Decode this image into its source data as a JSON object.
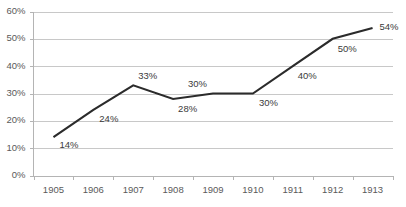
{
  "chart_data": {
    "type": "line",
    "title": "",
    "xlabel": "",
    "ylabel": "",
    "categories": [
      "1905",
      "1906",
      "1907",
      "1908",
      "1909",
      "1910",
      "1911",
      "1912",
      "1913"
    ],
    "values": [
      14,
      24,
      33,
      28,
      30,
      30,
      40,
      50,
      54
    ],
    "point_labels": [
      "14%",
      "24%",
      "33%",
      "28%",
      "30%",
      "30%",
      "40%",
      "50%",
      "54%"
    ],
    "ylim": [
      0,
      60
    ],
    "ytick_values": [
      0,
      10,
      20,
      30,
      40,
      50,
      60
    ],
    "ytick_labels": [
      "0%",
      "10%",
      "20%",
      "30%",
      "40%",
      "50%",
      "60%"
    ],
    "grid": true,
    "legend": "none",
    "series_color": "#2b2b2b",
    "grid_color": "#c8c8c8",
    "axis_color": "#b4b4b4",
    "tick_text_color": "#5a5a5a",
    "label_text_color": "#3a3a3a",
    "background_color": "#ffffff",
    "label_offsets": [
      {
        "dx": 6,
        "dy": 11
      },
      {
        "dx": 6,
        "dy": 12
      },
      {
        "dx": 5,
        "dy": -6
      },
      {
        "dx": 5,
        "dy": 13
      },
      {
        "dx": -6,
        "dy": -7
      },
      {
        "dx": 6,
        "dy": 12
      },
      {
        "dx": 5,
        "dy": 13
      },
      {
        "dx": 5,
        "dy": 13
      },
      {
        "dx": 7,
        "dy": 2
      }
    ]
  }
}
